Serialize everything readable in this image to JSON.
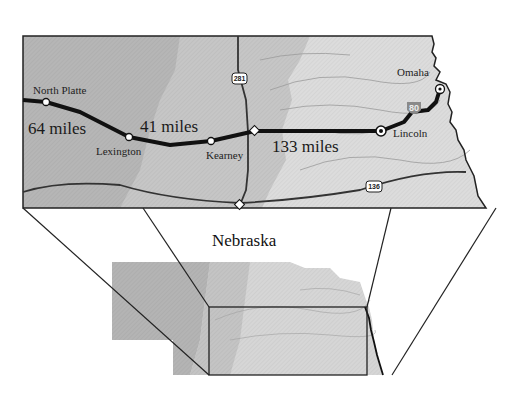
{
  "title": "Nebraska",
  "inset": {
    "cities": [
      {
        "name": "North Platte",
        "x": 46,
        "y": 102
      },
      {
        "name": "Lexington",
        "x": 129,
        "y": 137
      },
      {
        "name": "Kearney",
        "x": 211,
        "y": 141
      },
      {
        "name": "Lincoln",
        "x": 381,
        "y": 131
      },
      {
        "name": "Omaha",
        "x": 440,
        "y": 89
      }
    ],
    "distances": [
      {
        "label": "64 miles",
        "x": 28,
        "y": 134
      },
      {
        "label": "41 miles",
        "x": 140,
        "y": 132
      },
      {
        "label": "133 miles",
        "x": 272,
        "y": 152
      }
    ],
    "highways": [
      {
        "label": "281",
        "type": "us-route"
      },
      {
        "label": "136",
        "type": "us-route"
      },
      {
        "label": "80",
        "type": "interstate"
      }
    ]
  },
  "colors": {
    "west_terrain": "#b4b4b4",
    "central_terrain": "#c8c8c8",
    "east_terrain": "#dedede",
    "route": "#111111",
    "interstate_shield": "#8a8a8a"
  }
}
